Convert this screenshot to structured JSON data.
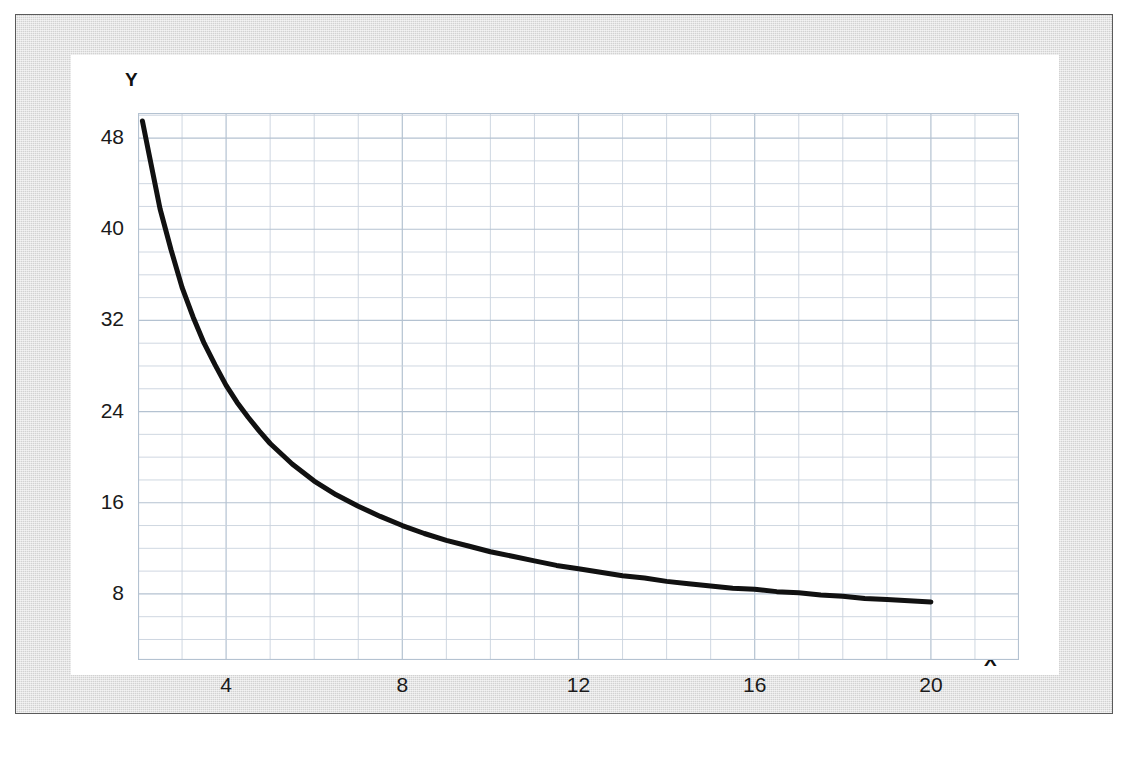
{
  "figure": {
    "frame_color": "#d2d2d2",
    "plot_background": "#ffffff",
    "grid_color": "#c9d3de",
    "grid_major_color": "#b4c2d1",
    "curve_color": "#111111",
    "axis_name_x": "X",
    "axis_name_y": "Y"
  },
  "chart_data": {
    "type": "line",
    "title": "",
    "subtitle": "",
    "xlabel": "X",
    "ylabel": "Y",
    "xlim": [
      2,
      22
    ],
    "ylim": [
      2.2,
      50.2
    ],
    "grid": true,
    "grid_major_step_x": 4,
    "grid_major_step_y": 8,
    "grid_minor_step_x": 1,
    "grid_minor_step_y": 2,
    "legend": null,
    "xticks": [
      4,
      8,
      12,
      16,
      20
    ],
    "xtick_labels": [
      "4",
      "8",
      "12",
      "16",
      "20"
    ],
    "yticks": [
      8,
      16,
      24,
      32,
      40,
      48
    ],
    "ytick_labels": [
      "8",
      "16",
      "24",
      "32",
      "40",
      "48"
    ],
    "series": [
      {
        "name": "curve",
        "color": "#111111",
        "linewidth": 5,
        "x": [
          2.1,
          2.25,
          2.5,
          2.75,
          3,
          3.25,
          3.5,
          3.75,
          4,
          4.25,
          4.5,
          4.75,
          5,
          5.5,
          6,
          6.5,
          7,
          7.5,
          8,
          8.5,
          9,
          9.5,
          10,
          10.5,
          11,
          11.5,
          12,
          12.5,
          13,
          13.5,
          14,
          14.5,
          15,
          15.5,
          16,
          16.5,
          17,
          17.5,
          18,
          18.5,
          19,
          19.5,
          20
        ],
        "y": [
          49.5,
          46.6,
          41.8,
          38.2,
          34.9,
          32.3,
          30.0,
          28.1,
          26.3,
          24.8,
          23.5,
          22.3,
          21.2,
          19.4,
          17.9,
          16.7,
          15.7,
          14.8,
          14.0,
          13.3,
          12.7,
          12.2,
          11.7,
          11.3,
          10.9,
          10.5,
          10.2,
          9.9,
          9.6,
          9.4,
          9.1,
          8.9,
          8.7,
          8.5,
          8.4,
          8.2,
          8.1,
          7.9,
          7.8,
          7.6,
          7.5,
          7.4,
          7.3
        ]
      }
    ]
  }
}
